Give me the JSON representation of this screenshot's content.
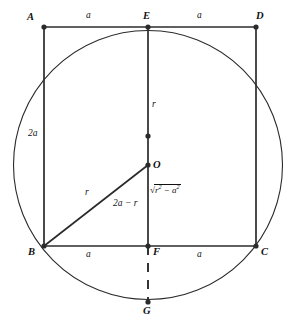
{
  "figure": {
    "type": "euclidean-geometry-diagram",
    "stroke_color": "#2b2b2b",
    "background_color": "#ffffff"
  },
  "points": [
    {
      "name": "A",
      "label": "A",
      "x": 44,
      "y": 27,
      "label_x": 27,
      "label_y": 12,
      "dot": true
    },
    {
      "name": "E",
      "label": "E",
      "x": 148,
      "y": 27,
      "label_x": 143,
      "label_y": 11,
      "dot": true
    },
    {
      "name": "D",
      "label": "D",
      "x": 256,
      "y": 27,
      "label_x": 256,
      "label_y": 11,
      "dot": true
    },
    {
      "name": "B",
      "label": "B",
      "x": 44,
      "y": 246,
      "label_x": 28,
      "label_y": 247,
      "dot": true
    },
    {
      "name": "F",
      "label": "F",
      "x": 148,
      "y": 246,
      "label_x": 153,
      "label_y": 247,
      "dot": true
    },
    {
      "name": "C",
      "label": "C",
      "x": 256,
      "y": 246,
      "label_x": 261,
      "label_y": 247,
      "dot": true
    },
    {
      "name": "O",
      "label": "O",
      "x": 148,
      "y": 165,
      "label_x": 153,
      "label_y": 160,
      "dot": true
    },
    {
      "name": "G",
      "label": "G",
      "x": 148,
      "y": 302,
      "label_x": 143,
      "label_y": 306,
      "dot": true
    },
    {
      "name": "M",
      "label": "",
      "x": 148,
      "y": 136,
      "label_x": 0,
      "label_y": 0,
      "dot": true
    }
  ],
  "circle": {
    "center_x": 148,
    "center_y": 165,
    "radius": 134.5
  },
  "segments": [
    {
      "name": "top-edge-AD",
      "x1": 44,
      "y1": 27,
      "x2": 256,
      "y2": 27,
      "style": "solid"
    },
    {
      "name": "bottom-edge-BC",
      "x1": 44,
      "y1": 246,
      "x2": 256,
      "y2": 246,
      "style": "solid"
    },
    {
      "name": "left-edge-AB",
      "x1": 44,
      "y1": 27,
      "x2": 44,
      "y2": 246,
      "style": "solid"
    },
    {
      "name": "right-edge-DC",
      "x1": 256,
      "y1": 27,
      "x2": 256,
      "y2": 246,
      "style": "solid"
    },
    {
      "name": "vertical-median-EF",
      "x1": 148,
      "y1": 27,
      "x2": 148,
      "y2": 246,
      "style": "solid"
    },
    {
      "name": "radius-BO",
      "x1": 44,
      "y1": 246,
      "x2": 148,
      "y2": 165,
      "style": "solid"
    },
    {
      "name": "dashed-FG",
      "x1": 148,
      "y1": 246,
      "x2": 148,
      "y2": 302,
      "style": "dashed"
    }
  ],
  "measure_labels": [
    {
      "name": "top-left-a",
      "text": "a",
      "x": 86,
      "y": 11,
      "kind": "plain"
    },
    {
      "name": "top-right-a",
      "text": "a",
      "x": 197,
      "y": 11,
      "kind": "plain"
    },
    {
      "name": "bottom-left-a",
      "text": "a",
      "x": 86,
      "y": 250,
      "kind": "plain"
    },
    {
      "name": "bottom-right-a",
      "text": "a",
      "x": 197,
      "y": 250,
      "kind": "plain"
    },
    {
      "name": "left-side-2a",
      "text": "2a",
      "x": 28,
      "y": 129,
      "kind": "plain"
    },
    {
      "name": "upper-radius-r",
      "text": "r",
      "x": 152,
      "y": 100,
      "kind": "plain"
    },
    {
      "name": "diagonal-radius-r",
      "text": "r",
      "x": 85,
      "y": 188,
      "kind": "plain"
    },
    {
      "name": "lower-segment-2a-minus-r",
      "text": "2a − r",
      "x": 113,
      "y": 199,
      "kind": "plain"
    }
  ],
  "sqrt_label": {
    "name": "sqrt-r-squared-minus-a-squared",
    "x": 150,
    "y": 186,
    "radical": "√",
    "radicand_parts": [
      {
        "base": "r",
        "exp": "2"
      },
      {
        "op": " − "
      },
      {
        "base": "a",
        "exp": "2"
      }
    ],
    "plain_text": "√(r² − a²)"
  }
}
